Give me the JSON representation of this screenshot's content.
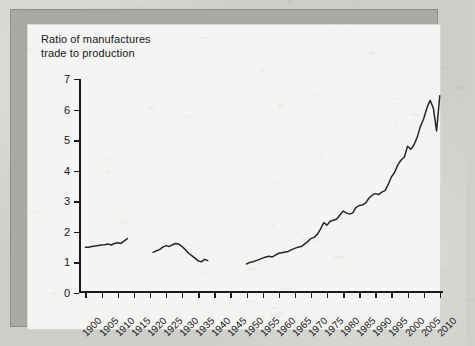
{
  "figure": {
    "title": "Ratio of manufactures\ntrade to production",
    "frame_color": "#a9a9a6",
    "panel_color": "#f4f4f2",
    "line_color": "#26262a"
  },
  "chart_data": {
    "type": "line",
    "title": "Ratio of manufactures trade to production",
    "xlabel": "",
    "ylabel": "Ratio of manufactures trade to production",
    "xlim": [
      1898,
      2011
    ],
    "ylim": [
      0,
      7
    ],
    "ytick_labels": [
      "0",
      "1",
      "2",
      "3",
      "4",
      "5",
      "6",
      "7"
    ],
    "yticks": [
      0,
      1,
      2,
      3,
      4,
      5,
      6,
      7
    ],
    "xtick_labels": [
      "1900",
      "1905",
      "1910",
      "1915",
      "1920",
      "1925",
      "1930",
      "1935",
      "1940",
      "1945",
      "1950",
      "1955",
      "1960",
      "1965",
      "1970",
      "1975",
      "1980",
      "1985",
      "1990",
      "1995",
      "2000",
      "2005",
      "2010"
    ],
    "xticks": [
      1900,
      1905,
      1910,
      1915,
      1920,
      1925,
      1930,
      1935,
      1940,
      1945,
      1950,
      1955,
      1960,
      1965,
      1970,
      1975,
      1980,
      1985,
      1990,
      1995,
      2000,
      2005,
      2010
    ],
    "grid": false,
    "legend": null,
    "series": [
      {
        "name": "Pre-WWI",
        "x": [
          1900,
          1901,
          1902,
          1903,
          1904,
          1905,
          1906,
          1907,
          1908,
          1909,
          1910,
          1911,
          1912,
          1913
        ],
        "values": [
          1.5,
          1.5,
          1.52,
          1.54,
          1.55,
          1.57,
          1.58,
          1.6,
          1.57,
          1.62,
          1.64,
          1.62,
          1.7,
          1.78
        ]
      },
      {
        "name": "Interwar",
        "x": [
          1921,
          1922,
          1923,
          1924,
          1925,
          1926,
          1927,
          1928,
          1929,
          1930,
          1931,
          1932,
          1933,
          1934,
          1935,
          1936,
          1937,
          1938
        ],
        "values": [
          1.33,
          1.38,
          1.42,
          1.5,
          1.55,
          1.52,
          1.58,
          1.62,
          1.6,
          1.52,
          1.42,
          1.3,
          1.22,
          1.14,
          1.05,
          1.02,
          1.1,
          1.06
        ]
      },
      {
        "name": "Post-WWII",
        "x": [
          1950,
          1951,
          1952,
          1953,
          1954,
          1955,
          1956,
          1957,
          1958,
          1959,
          1960,
          1961,
          1962,
          1963,
          1964,
          1965,
          1966,
          1967,
          1968,
          1969,
          1970,
          1971,
          1972,
          1973,
          1974,
          1975,
          1976,
          1977,
          1978,
          1979,
          1980,
          1981,
          1982,
          1983,
          1984,
          1985,
          1986,
          1987,
          1988,
          1989,
          1990,
          1991,
          1992,
          1993,
          1994,
          1995,
          1996,
          1997,
          1998,
          1999,
          2000,
          2001,
          2002,
          2003,
          2004,
          2005,
          2006,
          2007,
          2008,
          2009,
          2010
        ],
        "values": [
          0.95,
          1.0,
          1.02,
          1.06,
          1.1,
          1.14,
          1.18,
          1.2,
          1.18,
          1.24,
          1.3,
          1.32,
          1.34,
          1.36,
          1.42,
          1.46,
          1.5,
          1.52,
          1.6,
          1.68,
          1.78,
          1.82,
          1.92,
          2.1,
          2.3,
          2.22,
          2.35,
          2.38,
          2.42,
          2.55,
          2.68,
          2.62,
          2.58,
          2.62,
          2.8,
          2.86,
          2.88,
          2.95,
          3.1,
          3.2,
          3.25,
          3.22,
          3.3,
          3.35,
          3.55,
          3.8,
          3.95,
          4.2,
          4.35,
          4.45,
          4.8,
          4.7,
          4.85,
          5.1,
          5.45,
          5.7,
          6.05,
          6.3,
          6.05,
          5.3,
          6.45
        ]
      }
    ]
  }
}
